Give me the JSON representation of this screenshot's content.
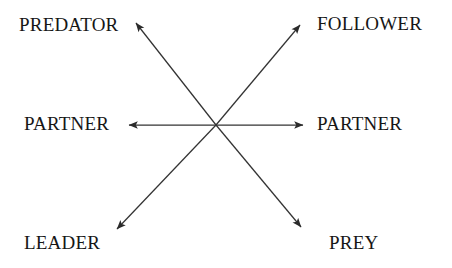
{
  "diagram": {
    "background_color": "#ffffff",
    "line_color": "#333333",
    "text_color": "#161616",
    "center": {
      "x": 216,
      "y": 125
    },
    "nodes": [
      {
        "id": "predator",
        "label": "PREDATOR",
        "position": "top-left"
      },
      {
        "id": "follower",
        "label": "FOLLOWER",
        "position": "top-right"
      },
      {
        "id": "partner-left",
        "label": "PARTNER",
        "position": "middle-left"
      },
      {
        "id": "partner-right",
        "label": "PARTNER",
        "position": "middle-right"
      },
      {
        "id": "leader",
        "label": "LEADER",
        "position": "bottom-left"
      },
      {
        "id": "prey",
        "label": "PREY",
        "position": "bottom-right"
      }
    ],
    "arrows": [
      {
        "id": "arrow-to-predator",
        "from": "center",
        "to": "predator",
        "x1": 216,
        "y1": 125,
        "x2": 136,
        "y2": 23
      },
      {
        "id": "arrow-to-follower",
        "from": "center",
        "to": "follower",
        "x1": 216,
        "y1": 125,
        "x2": 300,
        "y2": 25
      },
      {
        "id": "arrow-to-partner-left",
        "from": "center",
        "to": "partner-left",
        "x1": 216,
        "y1": 125,
        "x2": 128,
        "y2": 125
      },
      {
        "id": "arrow-to-partner-right",
        "from": "center",
        "to": "partner-right",
        "x1": 216,
        "y1": 125,
        "x2": 304,
        "y2": 125
      },
      {
        "id": "arrow-to-leader",
        "from": "center",
        "to": "leader",
        "x1": 216,
        "y1": 125,
        "x2": 116,
        "y2": 230
      },
      {
        "id": "arrow-to-prey",
        "from": "center",
        "to": "prey",
        "x1": 216,
        "y1": 125,
        "x2": 302,
        "y2": 228
      }
    ]
  }
}
